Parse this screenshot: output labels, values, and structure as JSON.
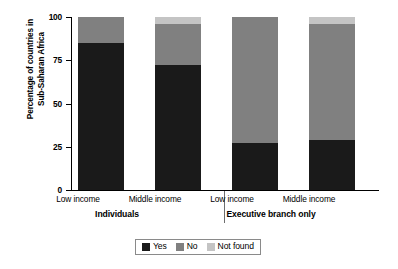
{
  "chart_data": {
    "type": "bar",
    "subtype": "stacked-bar-100",
    "title": "",
    "xlabel": "",
    "ylabel": "Percentage of countries in\nSub-Saharan Africa",
    "ylim": [
      0,
      100
    ],
    "yticks": [
      "0",
      "25",
      "50",
      "75",
      "100"
    ],
    "ytick_values": [
      0,
      25,
      50,
      75,
      100
    ],
    "grid": false,
    "legend_position": "bottom",
    "categories": [
      "Low income",
      "Middle income",
      "Low income",
      "Middle income"
    ],
    "groups": [
      {
        "label": "Individuals",
        "categories": [
          "Low income",
          "Middle income"
        ]
      },
      {
        "label": "Executive branch only",
        "categories": [
          "Low income",
          "Middle income"
        ]
      }
    ],
    "series": [
      {
        "name": "Yes",
        "color": "#1a1a1a",
        "values": [
          85,
          72,
          27,
          29
        ]
      },
      {
        "name": "No",
        "color": "#808080",
        "values": [
          15,
          24,
          73,
          67
        ]
      },
      {
        "name": "Not found",
        "color": "#c4c4c4",
        "values": [
          0,
          4,
          0,
          4
        ]
      }
    ],
    "bars": [
      {
        "group": "Individuals",
        "category": "Low income",
        "segments": [
          {
            "name": "Yes",
            "value": 85
          },
          {
            "name": "No",
            "value": 15
          },
          {
            "name": "Not found",
            "value": 0
          }
        ]
      },
      {
        "group": "Individuals",
        "category": "Middle income",
        "segments": [
          {
            "name": "Yes",
            "value": 72
          },
          {
            "name": "No",
            "value": 24
          },
          {
            "name": "Not found",
            "value": 4
          }
        ]
      },
      {
        "group": "Executive branch only",
        "category": "Low income",
        "segments": [
          {
            "name": "Yes",
            "value": 27
          },
          {
            "name": "No",
            "value": 73
          },
          {
            "name": "Not found",
            "value": 0
          }
        ]
      },
      {
        "group": "Executive branch only",
        "category": "Middle income",
        "segments": [
          {
            "name": "Yes",
            "value": 29
          },
          {
            "name": "No",
            "value": 67
          },
          {
            "name": "Not found",
            "value": 4
          }
        ]
      }
    ]
  },
  "axis": {
    "y_title_line1": "Percentage of countries in",
    "y_title_line2": "Sub-Saharan Africa",
    "ticks": [
      {
        "label": "100",
        "value": 100
      },
      {
        "label": "75",
        "value": 75
      },
      {
        "label": "50",
        "value": 50
      },
      {
        "label": "25",
        "value": 25
      },
      {
        "label": "0",
        "value": 0
      }
    ]
  },
  "legend": {
    "items": [
      {
        "label": "Yes",
        "color": "#1a1a1a"
      },
      {
        "label": "No",
        "color": "#808080"
      },
      {
        "label": "Not found",
        "color": "#c4c4c4"
      }
    ]
  },
  "colors": {
    "yes": "#1a1a1a",
    "no": "#808080",
    "not_found": "#c4c4c4",
    "axis": "#000000",
    "separator": "#6e6e6e",
    "background": "#ffffff"
  }
}
